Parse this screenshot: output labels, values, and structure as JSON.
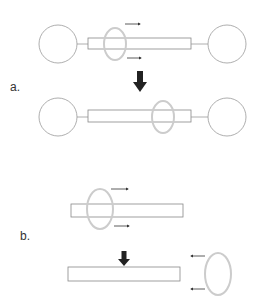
{
  "panels": [
    {
      "label": "a.",
      "description": "Ring on dumbbell-shaped axle slides from left to right; stoppers prevent dethreading"
    },
    {
      "label": "b.",
      "description": "Ring on open axle slides off the end and dethreads"
    }
  ],
  "colors": {
    "outline": "#888888",
    "ring": "#cccccc",
    "arrow": "#222222"
  }
}
